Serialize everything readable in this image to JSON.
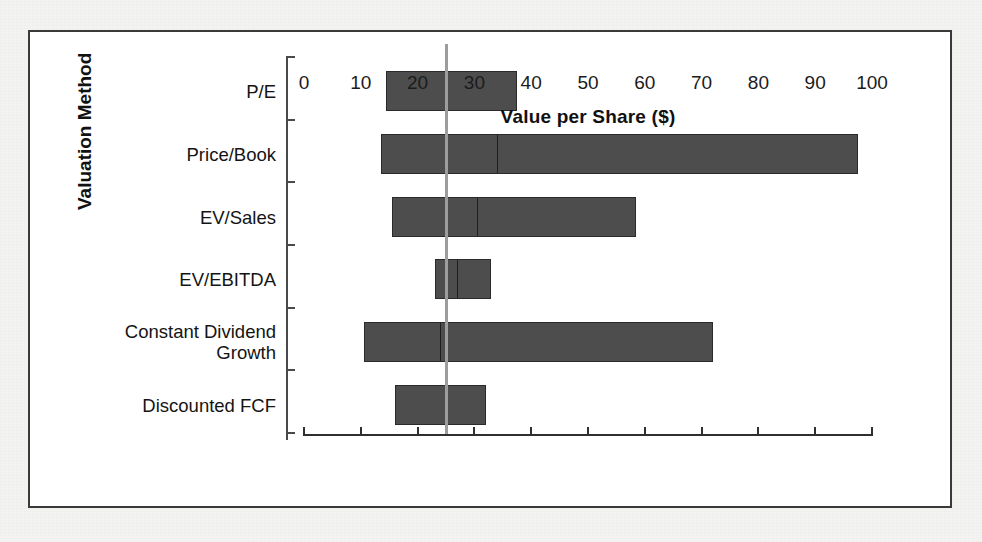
{
  "figure": {
    "background_color": "#f3f3f2",
    "panel_color": "#ffffff",
    "frame_color": "#3a3a3a",
    "bar_color": "#4d4d4d",
    "bar_edge_color": "#2a2a2a",
    "reference_line_color": "#9d9d9d"
  },
  "chart_data": {
    "type": "bar",
    "subtype": "horizontal-range-bar (football field valuation chart)",
    "title": "",
    "xlabel": "Value per Share ($)",
    "ylabel": "Valuation Method",
    "xlim": [
      0,
      100
    ],
    "xticks": [
      0,
      10,
      20,
      30,
      40,
      50,
      60,
      70,
      80,
      90,
      100
    ],
    "xtick_labels": [
      "0",
      "10",
      "20",
      "30",
      "40",
      "50",
      "60",
      "70",
      "80",
      "90",
      "100"
    ],
    "grid": false,
    "legend": "none",
    "orientation": "horizontal",
    "categories": [
      "P/E",
      "Price/Book",
      "EV/Sales",
      "EV/EBITDA",
      "Constant Dividend\nGrowth",
      "Discounted FCF"
    ],
    "reference_line": {
      "value": 25,
      "label": "",
      "orientation": "vertical"
    },
    "ranges": [
      {
        "category": "P/E",
        "low": 14.5,
        "mid": 25.0,
        "high": 37.5
      },
      {
        "category": "Price/Book",
        "low": 13.5,
        "mid": 34.0,
        "high": 97.5
      },
      {
        "category": "EV/Sales",
        "low": 15.5,
        "mid": 30.5,
        "high": 58.5
      },
      {
        "category": "EV/EBITDA",
        "low": 23.0,
        "mid": 27.0,
        "high": 33.0
      },
      {
        "category": "Constant Dividend Growth",
        "low": 10.5,
        "mid": 24.0,
        "high": 72.0
      },
      {
        "category": "Discounted FCF",
        "low": 16.0,
        "mid": 25.0,
        "high": 32.0
      }
    ]
  }
}
